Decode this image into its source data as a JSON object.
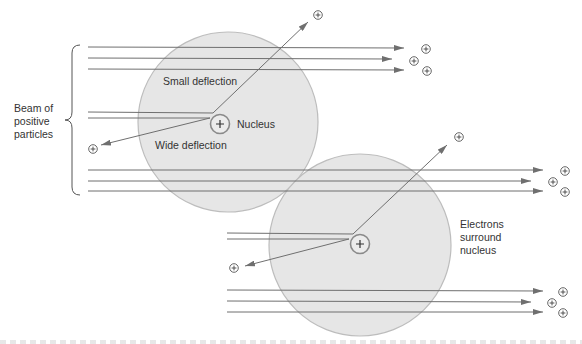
{
  "labels": {
    "beam": "Beam of positive particles",
    "small_deflection": "Small deflection",
    "nucleus": "Nucleus",
    "wide_deflection": "Wide deflection",
    "electrons": "Electrons surround nucleus"
  },
  "symbols": {
    "positive_particle": "+",
    "nucleus_charge": "+"
  },
  "colors": {
    "atom_fill": "#e6e6e6",
    "atom_stroke": "#b8b8b8",
    "line": "#6f6f6f",
    "text": "#333333"
  }
}
